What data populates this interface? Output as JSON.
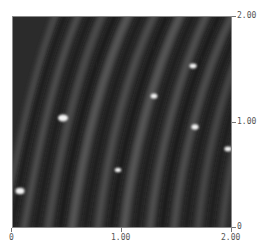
{
  "image": {
    "type": "afm-topography-scan",
    "colormap": "grayscale",
    "background_color": "#2a2a2a",
    "feature_color": "#f4f4f4"
  },
  "axes": {
    "x": {
      "ticks": [
        {
          "label": "0",
          "pos": 0
        },
        {
          "label": "1.00",
          "pos": 0.5
        },
        {
          "label": "2.00",
          "pos": 1
        }
      ]
    },
    "y": {
      "ticks": [
        {
          "label": "0",
          "pos": 0
        },
        {
          "label": "1.00",
          "pos": 0.5
        },
        {
          "label": "2.00",
          "pos": 1
        }
      ]
    }
  },
  "features": [
    {
      "name": "particle-1",
      "x": 0.04,
      "y": 0.17,
      "size": "medium"
    },
    {
      "name": "particle-2",
      "x": 0.23,
      "y": 0.52,
      "size": "large"
    },
    {
      "name": "particle-3",
      "x": 0.48,
      "y": 0.27,
      "size": "small"
    },
    {
      "name": "particle-4",
      "x": 0.64,
      "y": 0.62,
      "size": "small"
    },
    {
      "name": "particle-5",
      "x": 0.82,
      "y": 0.76,
      "size": "small"
    },
    {
      "name": "particle-6",
      "x": 0.83,
      "y": 0.47,
      "size": "small"
    },
    {
      "name": "particle-7",
      "x": 0.98,
      "y": 0.37,
      "size": "small"
    }
  ]
}
